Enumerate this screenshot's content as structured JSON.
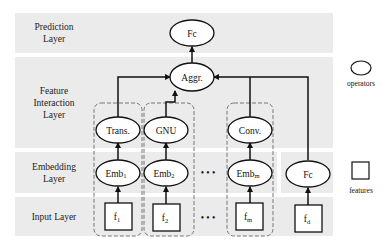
{
  "layers": [
    {
      "id": "prediction",
      "label": "Prediction Layer",
      "lines": [
        "Prediction",
        "Layer"
      ]
    },
    {
      "id": "feature_interaction",
      "label": "Feature Interaction Layer",
      "lines": [
        "Feature",
        "Interaction",
        "Layer"
      ]
    },
    {
      "id": "embedding",
      "label": "Embedding Layer",
      "lines": [
        "Embedding",
        "Layer"
      ]
    },
    {
      "id": "input",
      "label": "Input Layer",
      "lines": [
        "Input Layer"
      ]
    }
  ],
  "nodes": {
    "prediction_fc": "Fc",
    "aggregator": "Aggr.",
    "trans": "Trans.",
    "gnu": "GNU",
    "conv": "Conv.",
    "emb_1": {
      "base": "Emb",
      "sub": "1"
    },
    "emb_2": {
      "base": "Emb",
      "sub": "2"
    },
    "emb_m": {
      "base": "Emb",
      "sub": "m"
    },
    "dense_fc": "Fc",
    "f_1": {
      "base": "f",
      "sub": "1"
    },
    "f_2": {
      "base": "f",
      "sub": "2"
    },
    "f_m": {
      "base": "f",
      "sub": "m"
    },
    "f_d": {
      "base": "f",
      "sub": "d"
    }
  },
  "ellipsis": "• • •",
  "legend": {
    "operators_label": "operators",
    "features_label": "features"
  },
  "colors": {
    "band": "#ebebeb",
    "stroke": "#111111",
    "dashed": "#777777"
  }
}
